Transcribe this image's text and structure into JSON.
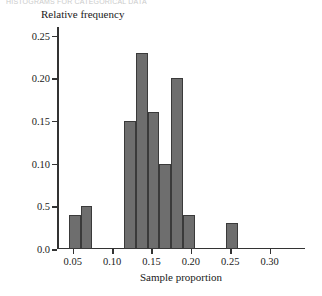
{
  "page": {
    "running_head": "HISTOGRAMS FOR CATEGORICAL DATA"
  },
  "chart_data": {
    "type": "bar",
    "title": "",
    "xlabel": "Sample proportion",
    "ylabel": "Relative frequency",
    "xlim": [
      0.03,
      0.345
    ],
    "ylim": [
      0.0,
      0.26
    ],
    "grid": false,
    "legend": null,
    "bin_width": 0.015,
    "bar_color": "#6e6e6e",
    "bar_edge_color": "#3a3a3a",
    "axis_color": "#333333",
    "xticks": [
      0.05,
      0.1,
      0.15,
      0.2,
      0.25,
      0.3
    ],
    "xtick_labels": [
      "0.05",
      "0.10",
      "0.15",
      "0.20",
      "0.25",
      "0.30"
    ],
    "yticks": [
      0.0,
      0.05,
      0.1,
      0.15,
      0.2,
      0.25
    ],
    "ytick_labels": [
      "0.0",
      "0.5",
      "0.10",
      "0.15",
      "0.20",
      "0.25"
    ],
    "bins": [
      {
        "left": 0.045,
        "right": 0.06,
        "value": 0.04
      },
      {
        "left": 0.06,
        "right": 0.075,
        "value": 0.05
      },
      {
        "left": 0.115,
        "right": 0.13,
        "value": 0.15
      },
      {
        "left": 0.13,
        "right": 0.145,
        "value": 0.23
      },
      {
        "left": 0.145,
        "right": 0.16,
        "value": 0.16
      },
      {
        "left": 0.16,
        "right": 0.175,
        "value": 0.1
      },
      {
        "left": 0.175,
        "right": 0.19,
        "value": 0.2
      },
      {
        "left": 0.19,
        "right": 0.205,
        "value": 0.04
      },
      {
        "left": 0.245,
        "right": 0.26,
        "value": 0.03
      }
    ],
    "x": [
      0.0525,
      0.0675,
      0.1225,
      0.1375,
      0.1525,
      0.1675,
      0.1825,
      0.1975,
      0.2525
    ],
    "values": [
      0.04,
      0.05,
      0.15,
      0.23,
      0.16,
      0.1,
      0.2,
      0.04,
      0.03
    ]
  }
}
